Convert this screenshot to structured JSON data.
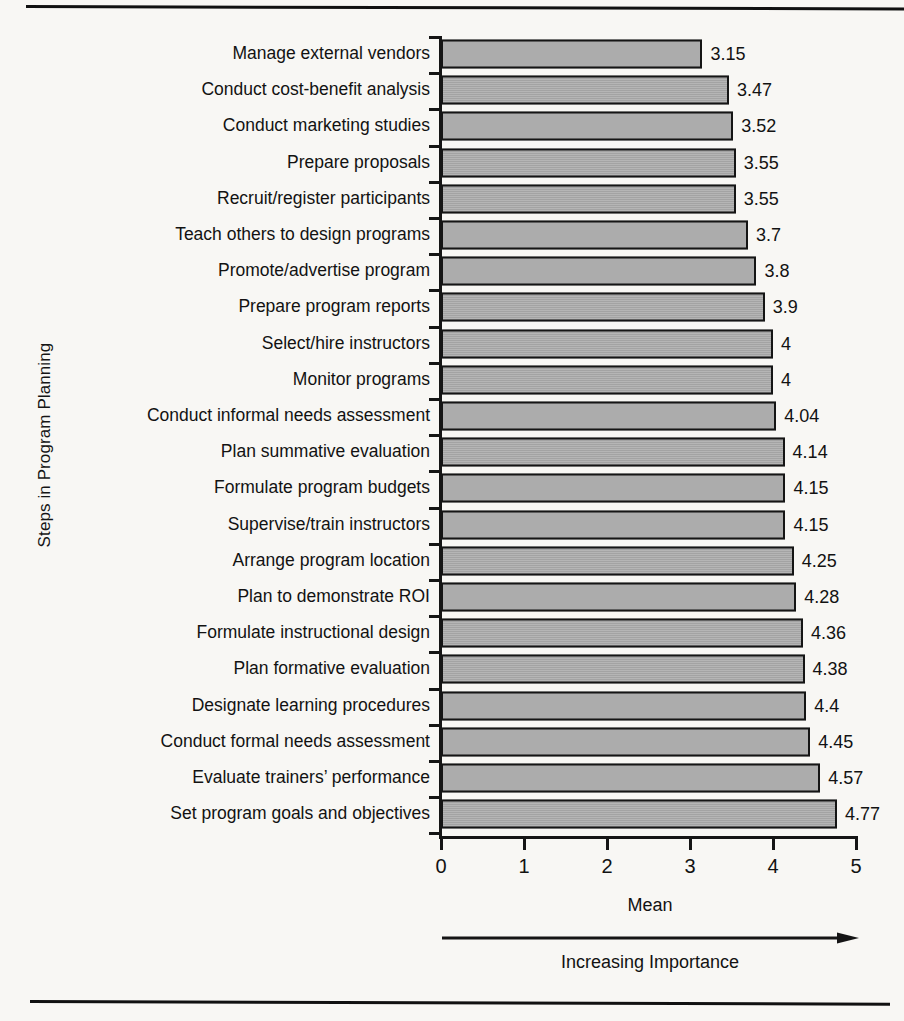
{
  "chart_data": {
    "type": "bar",
    "orientation": "horizontal",
    "title": "",
    "xlabel": "Mean",
    "ylabel": "Steps in Program Planning",
    "xlim": [
      0,
      5
    ],
    "xticks": [
      "0",
      "1",
      "2",
      "3",
      "4",
      "5"
    ],
    "grid": false,
    "legend": null,
    "annotation": "Increasing Importance",
    "bar_color": "#adadad",
    "bar_edge_color": "#151515",
    "categories": [
      "Manage external vendors",
      "Conduct cost-benefit analysis",
      "Conduct marketing studies",
      "Prepare proposals",
      "Recruit/register participants",
      "Teach others to design programs",
      "Promote/advertise program",
      "Prepare program reports",
      "Select/hire instructors",
      "Monitor programs",
      "Conduct informal needs assessment",
      "Plan summative evaluation",
      "Formulate program budgets",
      "Supervise/train instructors",
      "Arrange program location",
      "Plan to demonstrate ROI",
      "Formulate instructional design",
      "Plan formative evaluation",
      "Designate learning procedures",
      "Conduct formal needs assessment",
      "Evaluate trainers’ performance",
      "Set program goals and objectives"
    ],
    "values": [
      3.15,
      3.47,
      3.52,
      3.55,
      3.55,
      3.7,
      3.8,
      3.9,
      4,
      4,
      4.04,
      4.14,
      4.15,
      4.15,
      4.25,
      4.28,
      4.36,
      4.38,
      4.4,
      4.45,
      4.57,
      4.77
    ],
    "value_labels": [
      "3.15",
      "3.47",
      "3.52",
      "3.55",
      "3.55",
      "3.7",
      "3.8",
      "3.9",
      "4",
      "4",
      "4.04",
      "4.14",
      "4.15",
      "4.15",
      "4.25",
      "4.28",
      "4.36",
      "4.38",
      "4.4",
      "4.45",
      "4.57",
      "4.77"
    ]
  }
}
